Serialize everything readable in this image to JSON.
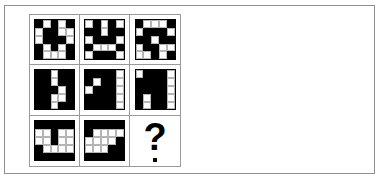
{
  "puzzle": {
    "type": "visual-analogy-matrix",
    "rows": 3,
    "columns": 3,
    "tile_grid_size": 5,
    "colors": {
      "filled": "#000000",
      "empty": "#ffffff",
      "grid_line": "#b5b5b5",
      "cell_border": "#9a9a9a",
      "panel_border": "#8f8f8f",
      "background": "#ffffff"
    },
    "missing_cell_label": "?",
    "cells": [
      {
        "name": "cell-r1c1",
        "row": 1,
        "column": 1,
        "kind": "pattern",
        "pattern": [
          [
            1,
            0,
            1,
            0,
            1
          ],
          [
            0,
            1,
            1,
            0,
            0
          ],
          [
            0,
            1,
            1,
            1,
            0
          ],
          [
            1,
            0,
            1,
            0,
            1
          ],
          [
            1,
            0,
            0,
            0,
            1
          ]
        ]
      },
      {
        "name": "cell-r1c2",
        "row": 1,
        "column": 2,
        "kind": "pattern",
        "pattern": [
          [
            0,
            1,
            0,
            1,
            0
          ],
          [
            1,
            1,
            0,
            1,
            1
          ],
          [
            0,
            1,
            1,
            1,
            0
          ],
          [
            1,
            0,
            0,
            0,
            1
          ],
          [
            0,
            1,
            1,
            1,
            0
          ]
        ]
      },
      {
        "name": "cell-r1c3",
        "row": 1,
        "column": 3,
        "kind": "pattern",
        "pattern": [
          [
            1,
            0,
            0,
            0,
            1
          ],
          [
            0,
            1,
            1,
            1,
            0
          ],
          [
            1,
            1,
            0,
            1,
            1
          ],
          [
            0,
            1,
            1,
            0,
            0
          ],
          [
            0,
            0,
            1,
            0,
            1
          ]
        ]
      },
      {
        "name": "cell-r2c1",
        "row": 2,
        "column": 1,
        "kind": "pattern",
        "pattern": [
          [
            1,
            1,
            0,
            1,
            1
          ],
          [
            1,
            1,
            0,
            1,
            1
          ],
          [
            1,
            1,
            1,
            0,
            1
          ],
          [
            1,
            1,
            0,
            0,
            1
          ],
          [
            1,
            1,
            0,
            1,
            1
          ]
        ]
      },
      {
        "name": "cell-r2c2",
        "row": 2,
        "column": 2,
        "kind": "pattern",
        "pattern": [
          [
            1,
            1,
            1,
            1,
            0
          ],
          [
            1,
            0,
            1,
            1,
            0
          ],
          [
            0,
            1,
            1,
            1,
            0
          ],
          [
            1,
            1,
            1,
            1,
            0
          ],
          [
            1,
            1,
            1,
            1,
            0
          ]
        ]
      },
      {
        "name": "cell-r2c3",
        "row": 2,
        "column": 3,
        "kind": "pattern",
        "pattern": [
          [
            0,
            1,
            1,
            1,
            0
          ],
          [
            1,
            1,
            1,
            1,
            0
          ],
          [
            1,
            1,
            1,
            1,
            0
          ],
          [
            1,
            0,
            1,
            1,
            0
          ],
          [
            1,
            0,
            1,
            1,
            0
          ]
        ]
      },
      {
        "name": "cell-r3c1",
        "row": 3,
        "column": 1,
        "kind": "pattern",
        "pattern": [
          [
            1,
            1,
            1,
            1,
            1
          ],
          [
            0,
            0,
            1,
            0,
            0
          ],
          [
            0,
            0,
            1,
            0,
            0
          ],
          [
            1,
            0,
            0,
            0,
            0
          ],
          [
            1,
            1,
            1,
            1,
            1
          ]
        ]
      },
      {
        "name": "cell-r3c2",
        "row": 3,
        "column": 2,
        "kind": "pattern",
        "pattern": [
          [
            1,
            1,
            1,
            1,
            1
          ],
          [
            1,
            0,
            0,
            0,
            0
          ],
          [
            0,
            0,
            0,
            0,
            1
          ],
          [
            0,
            0,
            0,
            1,
            1
          ],
          [
            1,
            1,
            1,
            1,
            1
          ]
        ]
      },
      {
        "name": "cell-r3c3",
        "row": 3,
        "column": 3,
        "kind": "question",
        "label": "?"
      }
    ]
  }
}
